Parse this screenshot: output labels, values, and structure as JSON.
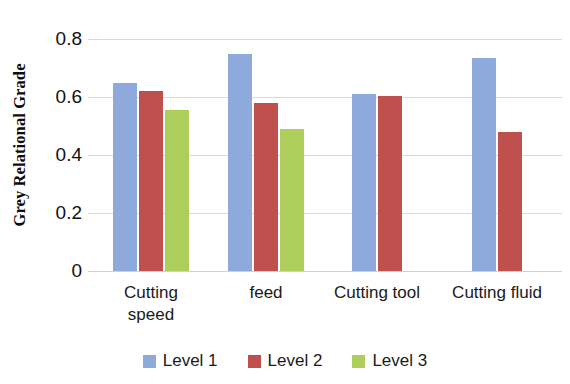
{
  "chart_data": {
    "type": "bar",
    "title": "",
    "subtitle": "",
    "xlabel": "",
    "ylabel": "Grey Relational Grade",
    "ylim": [
      0,
      0.8
    ],
    "ytick_labels": [
      "0.8",
      "0.6",
      "0.4",
      "0.2",
      "0"
    ],
    "ytick_values": [
      0.8,
      0.6,
      0.4,
      0.2,
      0
    ],
    "grid": true,
    "grid_axis": "y",
    "legend_position": "bottom",
    "categories": [
      "Cutting speed",
      "feed",
      "Cutting tool",
      "Cutting fluid"
    ],
    "series": [
      {
        "name": "Level 1",
        "color": "#8ea9db",
        "values": [
          0.65,
          0.75,
          0.61,
          0.735
        ]
      },
      {
        "name": "Level 2",
        "color": "#c0504d",
        "values": [
          0.62,
          0.58,
          0.605,
          0.48
        ]
      },
      {
        "name": "Level 3",
        "color": "#aece5c",
        "values": [
          0.555,
          0.49,
          null,
          null
        ]
      }
    ]
  },
  "axis": {
    "y_title": "Grey Relational Grade",
    "ticks": [
      {
        "label": "0.8",
        "value": 0.8
      },
      {
        "label": "0.6",
        "value": 0.6
      },
      {
        "label": "0.4",
        "value": 0.4
      },
      {
        "label": "0.2",
        "value": 0.2
      },
      {
        "label": "0",
        "value": 0
      }
    ]
  },
  "x_categories": [
    {
      "label_line1": "Cutting",
      "label_line2": "speed"
    },
    {
      "label_line1": "feed",
      "label_line2": ""
    },
    {
      "label_line1": "Cutting tool",
      "label_line2": ""
    },
    {
      "label_line1": "Cutting fluid",
      "label_line2": ""
    }
  ],
  "legend": {
    "items": [
      {
        "label": "Level 1",
        "color": "#8ea9db"
      },
      {
        "label": "Level 2",
        "color": "#c0504d"
      },
      {
        "label": "Level 3",
        "color": "#aece5c"
      }
    ]
  }
}
